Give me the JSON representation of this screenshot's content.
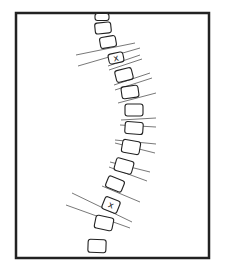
{
  "diagram": {
    "frame": {
      "x": 16,
      "y": 13,
      "w": 193,
      "h": 245,
      "stroke": "#222222"
    },
    "apex_marker_label": "x",
    "vertebrae": [
      {
        "cx": 102,
        "cy": 17,
        "w": 14,
        "h": 7,
        "rot": 0
      },
      {
        "cx": 103,
        "cy": 28,
        "w": 16,
        "h": 11,
        "rot": -6
      },
      {
        "cx": 108,
        "cy": 42,
        "w": 16,
        "h": 11,
        "rot": -10
      },
      {
        "cx": 116,
        "cy": 58,
        "w": 15,
        "h": 10,
        "rot": -12,
        "marked": true
      },
      {
        "cx": 124,
        "cy": 75,
        "w": 17,
        "h": 12,
        "rot": -14
      },
      {
        "cx": 130,
        "cy": 92,
        "w": 17,
        "h": 12,
        "rot": -8
      },
      {
        "cx": 134,
        "cy": 110,
        "w": 18,
        "h": 12,
        "rot": 0
      },
      {
        "cx": 134,
        "cy": 128,
        "w": 18,
        "h": 12,
        "rot": 4
      },
      {
        "cx": 131,
        "cy": 147,
        "w": 18,
        "h": 13,
        "rot": 10
      },
      {
        "cx": 124,
        "cy": 166,
        "w": 18,
        "h": 13,
        "rot": 16
      },
      {
        "cx": 115,
        "cy": 184,
        "w": 17,
        "h": 12,
        "rot": 22
      },
      {
        "cx": 111,
        "cy": 205,
        "w": 16,
        "h": 13,
        "rot": 22,
        "marked": true
      },
      {
        "cx": 104,
        "cy": 223,
        "w": 18,
        "h": 13,
        "rot": 12
      },
      {
        "cx": 97,
        "cy": 246,
        "w": 18,
        "h": 13,
        "rot": 2
      }
    ],
    "lines": [
      {
        "x1": 76,
        "y1": 55,
        "x2": 135,
        "y2": 43
      },
      {
        "x1": 78,
        "y1": 66,
        "x2": 140,
        "y2": 48
      },
      {
        "x1": 108,
        "y1": 66,
        "x2": 140,
        "y2": 55
      },
      {
        "x1": 109,
        "y1": 70,
        "x2": 142,
        "y2": 59
      },
      {
        "x1": 114,
        "y1": 85,
        "x2": 150,
        "y2": 73
      },
      {
        "x1": 115,
        "y1": 90,
        "x2": 152,
        "y2": 78
      },
      {
        "x1": 118,
        "y1": 103,
        "x2": 156,
        "y2": 93
      },
      {
        "x1": 121,
        "y1": 120,
        "x2": 156,
        "y2": 118
      },
      {
        "x1": 120,
        "y1": 125,
        "x2": 156,
        "y2": 127
      },
      {
        "x1": 115,
        "y1": 140,
        "x2": 156,
        "y2": 144
      },
      {
        "x1": 115,
        "y1": 143,
        "x2": 155,
        "y2": 153
      },
      {
        "x1": 110,
        "y1": 162,
        "x2": 150,
        "y2": 172
      },
      {
        "x1": 109,
        "y1": 167,
        "x2": 147,
        "y2": 181
      },
      {
        "x1": 102,
        "y1": 186,
        "x2": 140,
        "y2": 202
      },
      {
        "x1": 72,
        "y1": 193,
        "x2": 132,
        "y2": 222
      },
      {
        "x1": 66,
        "y1": 205,
        "x2": 130,
        "y2": 228
      }
    ]
  }
}
